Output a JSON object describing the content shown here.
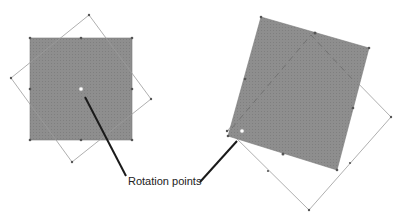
{
  "diagram": {
    "label": "Rotation points",
    "colors": {
      "fill": "#8c8c8c",
      "outline": "#9a9a9a",
      "handle": "#555555",
      "pivot": "#ffffff",
      "leader": "#1a1a1a",
      "background": "#ffffff"
    },
    "left": {
      "filled_square": [
        [
          30,
          38
        ],
        [
          132,
          38
        ],
        [
          132,
          140
        ],
        [
          30,
          140
        ]
      ],
      "rotated_outline": [
        [
          89,
          15
        ],
        [
          151,
          99
        ],
        [
          72,
          162
        ],
        [
          11,
          78
        ]
      ],
      "pivot": [
        81,
        89
      ]
    },
    "right": {
      "filled_shape": [
        [
          261,
          17
        ],
        [
          369,
          48
        ],
        [
          337,
          170
        ],
        [
          228,
          136
        ]
      ],
      "outline": [
        [
          311,
          35
        ],
        [
          391,
          117
        ],
        [
          309,
          210
        ],
        [
          228,
          130
        ]
      ],
      "pivot": [
        242,
        131
      ]
    },
    "leaders": [
      {
        "from": [
          85,
          97
        ],
        "to": [
          126,
          176
        ]
      },
      {
        "from": [
          237,
          141
        ],
        "to": [
          200,
          182
        ]
      }
    ]
  }
}
